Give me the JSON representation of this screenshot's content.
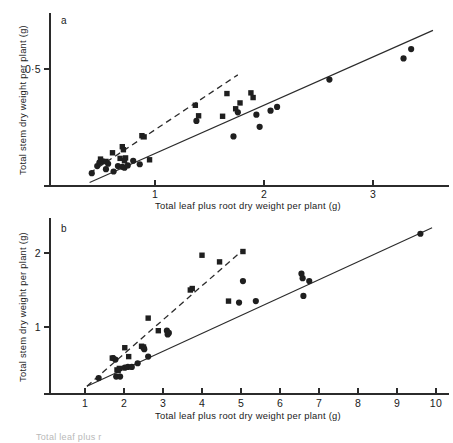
{
  "figure": {
    "panels": [
      {
        "letter": "a",
        "xlabel": "Total leaf plus root dry weight per plant (g)",
        "ylabel": "Total stem dry weight per plant (g)",
        "xticks": [
          "1",
          "2",
          "3"
        ],
        "yticks": [
          "0·5"
        ]
      },
      {
        "letter": "b",
        "xlabel": "Total leaf plus root dry weight per plant (g)",
        "ylabel": "Total stem dry weight per plant (g)",
        "xticks": [
          "1",
          "2",
          "3",
          "4",
          "5",
          "6",
          "7",
          "8",
          "9",
          "10"
        ],
        "yticks": [
          "1",
          "2"
        ]
      }
    ],
    "caption_fragment": "Total leaf plus r"
  },
  "chart_data": [
    {
      "type": "scatter",
      "title": "a",
      "xlabel": "Total leaf plus root dry weight per plant (g)",
      "ylabel": "Total stem dry weight per plant (g)",
      "xlim": [
        0.0,
        3.7
      ],
      "ylim": [
        0.0,
        0.78
      ],
      "xticks": [
        1,
        2,
        3
      ],
      "yticks": [
        0.5
      ],
      "grid": false,
      "legend": false,
      "series": [
        {
          "name": "circles",
          "marker": "circle",
          "points": [
            [
              0.42,
              0.055
            ],
            [
              0.47,
              0.085
            ],
            [
              0.49,
              0.1
            ],
            [
              0.52,
              0.105
            ],
            [
              0.55,
              0.072
            ],
            [
              0.57,
              0.095
            ],
            [
              0.62,
              0.062
            ],
            [
              0.66,
              0.085
            ],
            [
              0.7,
              0.082
            ],
            [
              0.72,
              0.078
            ],
            [
              0.75,
              0.088
            ],
            [
              0.8,
              0.108
            ],
            [
              0.86,
              0.093
            ],
            [
              1.38,
              0.278
            ],
            [
              1.72,
              0.212
            ],
            [
              1.76,
              0.315
            ],
            [
              1.93,
              0.305
            ],
            [
              1.96,
              0.253
            ],
            [
              2.06,
              0.322
            ],
            [
              2.12,
              0.338
            ],
            [
              2.6,
              0.455
            ],
            [
              3.28,
              0.545
            ],
            [
              3.35,
              0.585
            ]
          ]
        },
        {
          "name": "squares",
          "marker": "square",
          "points": [
            [
              0.5,
              0.115
            ],
            [
              0.55,
              0.105
            ],
            [
              0.61,
              0.142
            ],
            [
              0.68,
              0.118
            ],
            [
              0.7,
              0.168
            ],
            [
              0.71,
              0.155
            ],
            [
              0.72,
              0.108
            ],
            [
              0.73,
              0.12
            ],
            [
              0.88,
              0.215
            ],
            [
              0.9,
              0.21
            ],
            [
              0.95,
              0.112
            ],
            [
              1.37,
              0.345
            ],
            [
              1.4,
              0.3
            ],
            [
              1.62,
              0.298
            ],
            [
              1.66,
              0.395
            ],
            [
              1.74,
              0.33
            ],
            [
              1.78,
              0.355
            ],
            [
              1.88,
              0.398
            ],
            [
              1.9,
              0.378
            ]
          ]
        }
      ],
      "fits": [
        {
          "name": "solid-line",
          "style": "solid",
          "x": [
            0.4,
            3.55
          ],
          "y": [
            0.015,
            0.665
          ]
        },
        {
          "name": "dashed-line",
          "style": "dashed",
          "x": [
            0.4,
            1.76
          ],
          "y": [
            0.055,
            0.475
          ]
        }
      ]
    },
    {
      "type": "scatter",
      "title": "b",
      "xlabel": "Total leaf plus root dry weight per plant (g)",
      "ylabel": "Total stem dry weight per plant (g)",
      "xlim": [
        0.0,
        10.6
      ],
      "ylim": [
        0.0,
        2.55
      ],
      "xticks": [
        1,
        2,
        3,
        4,
        5,
        6,
        7,
        8,
        9,
        10
      ],
      "yticks": [
        1,
        2
      ],
      "grid": false,
      "legend": false,
      "series": [
        {
          "name": "circles",
          "marker": "circle",
          "points": [
            [
              1.35,
              0.31
            ],
            [
              1.72,
              0.58
            ],
            [
              1.78,
              0.56
            ],
            [
              1.8,
              0.33
            ],
            [
              1.9,
              0.33
            ],
            [
              2.02,
              0.45
            ],
            [
              2.1,
              0.46
            ],
            [
              2.2,
              0.46
            ],
            [
              2.35,
              0.51
            ],
            [
              2.5,
              0.72
            ],
            [
              2.52,
              0.7
            ],
            [
              2.62,
              0.6
            ],
            [
              3.1,
              0.95
            ],
            [
              3.12,
              0.9
            ],
            [
              3.15,
              0.92
            ],
            [
              4.95,
              1.33
            ],
            [
              5.05,
              1.62
            ],
            [
              5.38,
              1.35
            ],
            [
              6.55,
              1.72
            ],
            [
              6.58,
              1.66
            ],
            [
              6.6,
              1.42
            ],
            [
              6.75,
              1.62
            ],
            [
              9.6,
              2.26
            ]
          ]
        },
        {
          "name": "squares",
          "marker": "square",
          "points": [
            [
              1.7,
              0.58
            ],
            [
              1.82,
              0.42
            ],
            [
              1.85,
              0.41
            ],
            [
              1.88,
              0.44
            ],
            [
              2.02,
              0.72
            ],
            [
              2.12,
              0.6
            ],
            [
              2.45,
              0.74
            ],
            [
              2.5,
              0.73
            ],
            [
              2.62,
              1.12
            ],
            [
              2.88,
              0.95
            ],
            [
              3.7,
              1.5
            ],
            [
              3.75,
              1.52
            ],
            [
              4.0,
              1.97
            ],
            [
              4.45,
              1.88
            ],
            [
              4.68,
              1.35
            ],
            [
              5.05,
              2.02
            ]
          ]
        }
      ],
      "fits": [
        {
          "name": "solid-line",
          "style": "solid",
          "x": [
            1.05,
            9.9
          ],
          "y": [
            0.2,
            2.34
          ]
        },
        {
          "name": "dashed-line",
          "style": "dashed",
          "x": [
            1.05,
            5.05
          ],
          "y": [
            0.2,
            2.04
          ]
        }
      ]
    }
  ]
}
